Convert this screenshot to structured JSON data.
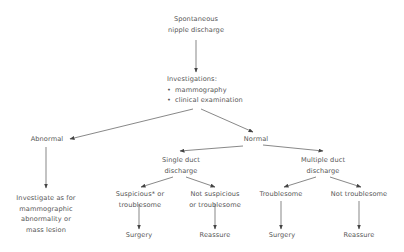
{
  "diagram": {
    "type": "flowchart",
    "nodes": {
      "start": {
        "lines": [
          "Spontaneous",
          "nipple discharge"
        ]
      },
      "investigations": {
        "title": "Investigations:",
        "bullets": [
          "mammography",
          "clinical examination"
        ]
      },
      "abnormal": {
        "lines": [
          "Abnormal"
        ]
      },
      "normal": {
        "lines": [
          "Normal"
        ]
      },
      "investigate": {
        "lines": [
          "Investigate as for",
          "mammographic",
          "abnormality or",
          "mass lesion"
        ]
      },
      "single_duct": {
        "lines": [
          "Single duct",
          "discharge"
        ]
      },
      "multiple_duct": {
        "lines": [
          "Multiple duct",
          "discharge"
        ]
      },
      "suspicious": {
        "lines": [
          "Suspicious* or",
          "troublesome"
        ]
      },
      "not_suspicious": {
        "lines": [
          "Not suspicious",
          "or troublesome"
        ]
      },
      "troublesome": {
        "lines": [
          "Troublesome"
        ]
      },
      "not_troublesome": {
        "lines": [
          "Not troublesome"
        ]
      },
      "surgery_1": {
        "lines": [
          "Surgery"
        ]
      },
      "reassure_1": {
        "lines": [
          "Reassure"
        ]
      },
      "surgery_2": {
        "lines": [
          "Surgery"
        ]
      },
      "reassure_2": {
        "lines": [
          "Reassure"
        ]
      }
    },
    "edges": [
      [
        "start",
        "investigations"
      ],
      [
        "investigations",
        "abnormal"
      ],
      [
        "investigations",
        "normal"
      ],
      [
        "abnormal",
        "investigate"
      ],
      [
        "normal",
        "single_duct"
      ],
      [
        "normal",
        "multiple_duct"
      ],
      [
        "single_duct",
        "suspicious"
      ],
      [
        "single_duct",
        "not_suspicious"
      ],
      [
        "multiple_duct",
        "troublesome"
      ],
      [
        "multiple_duct",
        "not_troublesome"
      ],
      [
        "suspicious",
        "surgery_1"
      ],
      [
        "not_suspicious",
        "reassure_1"
      ],
      [
        "troublesome",
        "surgery_2"
      ],
      [
        "not_troublesome",
        "reassure_2"
      ]
    ],
    "colors": {
      "text": "#555555",
      "line": "#555555",
      "background": "#ffffff"
    }
  }
}
